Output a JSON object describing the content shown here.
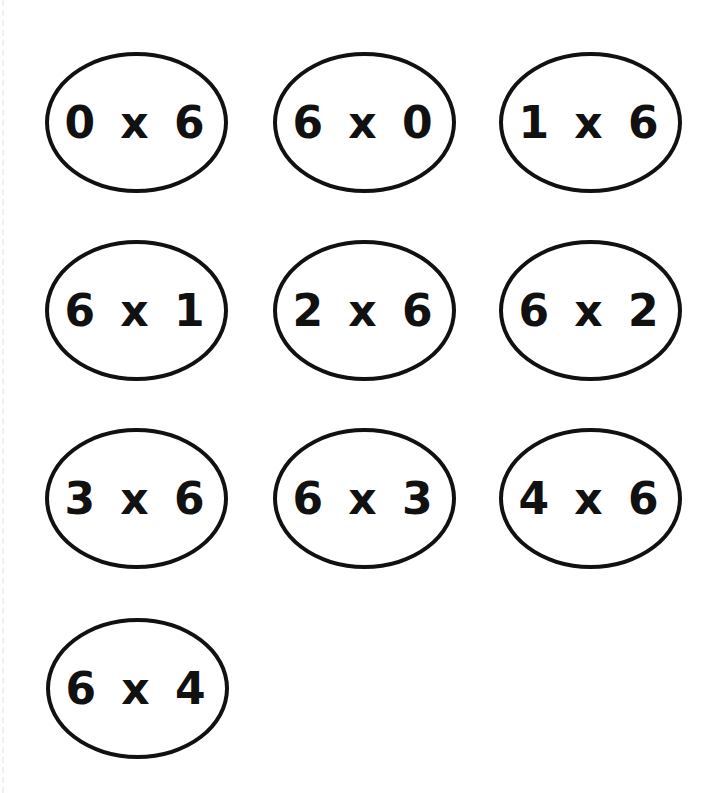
{
  "worksheet": {
    "cards": [
      {
        "label": "0 x 6"
      },
      {
        "label": "6 x 0"
      },
      {
        "label": "1 x 6"
      },
      {
        "label": "6 x 1"
      },
      {
        "label": "2 x 6"
      },
      {
        "label": "6 x 2"
      },
      {
        "label": "3 x 6"
      },
      {
        "label": "6 x 3"
      },
      {
        "label": "4 x 6"
      },
      {
        "label": "6 x 4"
      }
    ]
  }
}
